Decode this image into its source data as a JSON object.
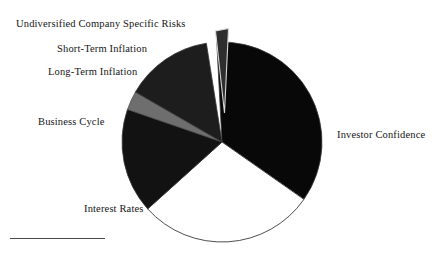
{
  "figure": {
    "title": "",
    "background_color": "#ffffff",
    "footnote_rule_color": "#4a4a4a"
  },
  "chart_data": {
    "type": "pie",
    "title": "",
    "xlabel": "",
    "ylabel": "",
    "legend_position": "none",
    "labels_position": "outside-callout",
    "grid": false,
    "center": {
      "x": 222,
      "y": 142
    },
    "radius": 100,
    "start_angle_deg": -3,
    "direction": "clockwise",
    "categories": [
      "Investor Confidence",
      "Interest Rates",
      "Business Cycle",
      "Long-Term Inflation",
      "Short-Term Inflation",
      "Undiversified Company Specific Risks"
    ],
    "values": [
      35.5,
      28.5,
      17.0,
      3.0,
      13.5,
      2.5
    ],
    "slices": [
      {
        "label": "Investor Confidence",
        "value": 35.5,
        "color": "#080808",
        "start_deg": -3,
        "end_deg": 125,
        "exploded": false,
        "label_x": 337,
        "label_y": 129
      },
      {
        "label": "Interest Rates",
        "value": 28.5,
        "color": "#ffffff",
        "start_deg": 125,
        "end_deg": 228,
        "exploded": false,
        "label_x": 84,
        "label_y": 203
      },
      {
        "label": "Business Cycle",
        "value": 17.0,
        "color": "#121212",
        "start_deg": 228,
        "end_deg": 289,
        "exploded": false,
        "label_x": 38,
        "label_y": 116
      },
      {
        "label": "Long-Term Inflation",
        "value": 3.0,
        "color": "#6e6e6e",
        "start_deg": 289,
        "end_deg": 300,
        "exploded": false,
        "label_x": 48,
        "label_y": 66
      },
      {
        "label": "Short-Term Inflation",
        "value": 13.5,
        "color": "#1d1d1d",
        "start_deg": 300,
        "end_deg": 351,
        "exploded": false,
        "label_x": 57,
        "label_y": 43
      },
      {
        "label": "Undiversified Company Specific Risks",
        "value": 2.5,
        "color": "#2e2e2e",
        "start_deg": 351,
        "end_deg": 357,
        "exploded": true,
        "label_x": 16,
        "label_y": 18
      }
    ],
    "colors": {
      "investor_confidence": "#080808",
      "interest_rates": "#ffffff",
      "business_cycle": "#121212",
      "long_term_inflation": "#6e6e6e",
      "short_term_inflation": "#1d1d1d",
      "undiversified_risks": "#2e2e2e",
      "outline": "#3a3a3a"
    }
  },
  "labels": {
    "undiversified": "Undiversified Company Specific Risks",
    "short_term_inflation": "Short-Term Inflation",
    "long_term_inflation": "Long-Term Inflation",
    "business_cycle": "Business Cycle",
    "interest_rates": "Interest Rates",
    "investor_confidence": "Investor Confidence"
  }
}
